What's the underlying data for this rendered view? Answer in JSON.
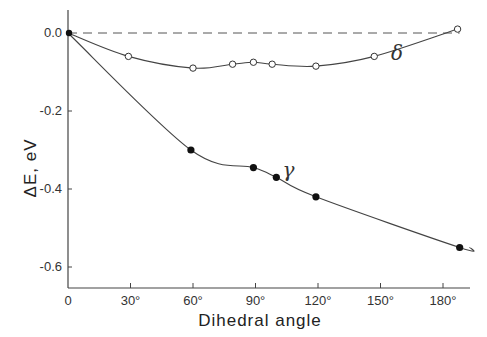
{
  "chart_data": {
    "type": "line",
    "title": "",
    "xlabel": "Dihedral angle",
    "ylabel": "ΔE, eV",
    "xlim": [
      0,
      195
    ],
    "ylim": [
      -0.66,
      0.05
    ],
    "grid": false,
    "x_ticks": [
      0,
      30,
      60,
      90,
      120,
      150,
      180
    ],
    "x_tick_labels": [
      "0",
      "30°",
      "60°",
      "90°",
      "120°",
      "150°",
      "180°"
    ],
    "y_ticks": [
      0.0,
      -0.2,
      -0.4,
      -0.6
    ],
    "y_tick_labels": [
      "0.0",
      "-0.2",
      "-0.4",
      "-0.6"
    ],
    "reference_line": {
      "y": 0.0,
      "style": "dashed"
    },
    "series": [
      {
        "name": "δ",
        "marker": "open-circle",
        "x": [
          0,
          29,
          60,
          79,
          89,
          98,
          119,
          147,
          187
        ],
        "values": [
          0.0,
          -0.06,
          -0.09,
          -0.08,
          -0.075,
          -0.08,
          -0.085,
          -0.06,
          0.01
        ]
      },
      {
        "name": "γ",
        "marker": "filled-circle",
        "x": [
          0,
          59,
          89,
          100,
          119,
          188
        ],
        "values": [
          0.0,
          -0.3,
          -0.345,
          -0.37,
          -0.42,
          -0.55
        ]
      }
    ],
    "annotations": [
      {
        "text": "δ",
        "x": 155,
        "y": -0.05
      },
      {
        "text": "γ",
        "x": 103,
        "y": -0.35
      }
    ]
  }
}
